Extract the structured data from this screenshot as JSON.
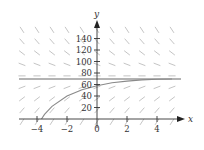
{
  "chart_data": {
    "type": "line",
    "title": "",
    "xlabel": "x",
    "ylabel": "y",
    "x_ticks": [
      "-4",
      "-2",
      "0",
      "2",
      "4"
    ],
    "y_ticks": [
      "20",
      "40",
      "60",
      "80",
      "100",
      "120",
      "140"
    ],
    "xlim": [
      -5,
      5.5
    ],
    "ylim": [
      -15,
      160
    ],
    "grid": false,
    "slope_field": true,
    "equilibrium": {
      "name": "equilibrium solution",
      "y": 70
    },
    "series": [
      {
        "name": "solution curve",
        "x": [
          -3.7,
          -3.5,
          -3,
          -2,
          -1,
          0,
          1,
          2,
          3,
          4,
          5
        ],
        "y": [
          0,
          8,
          22,
          40,
          51,
          58,
          63,
          66,
          68,
          69,
          69.5
        ]
      }
    ],
    "colors": {
      "axis": "#333333",
      "curve": "#888888",
      "equilibrium": "#999999",
      "slope": "#bbbbbb"
    }
  },
  "axes": {
    "x_label": "x",
    "y_label": "y"
  }
}
